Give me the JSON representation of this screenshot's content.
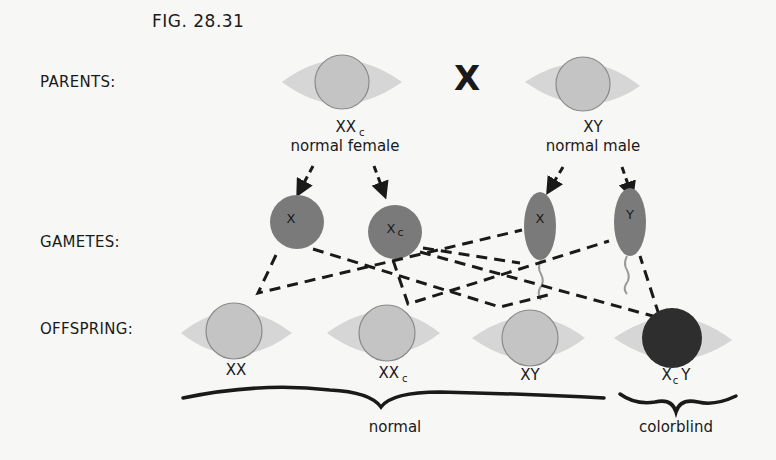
{
  "figure": {
    "title": "FIG. 28.31"
  },
  "rows": {
    "parents": "PARENTS:",
    "gametes": "GAMETES:",
    "offspring": "OFFSPRING:"
  },
  "cross_symbol": "X",
  "parents": [
    {
      "genotype_main": "XX",
      "genotype_sub": "c",
      "description": "normal female",
      "phenotype": "normal"
    },
    {
      "genotype_main": "XY",
      "genotype_sub": "",
      "description": "normal male",
      "phenotype": "normal"
    }
  ],
  "gametes": [
    {
      "label_main": "X",
      "label_sub": "",
      "type": "egg"
    },
    {
      "label_main": "X",
      "label_sub": "c",
      "type": "egg"
    },
    {
      "label_main": "X",
      "label_sub": "",
      "type": "sperm"
    },
    {
      "label_main": "Y",
      "label_sub": "",
      "type": "sperm"
    }
  ],
  "offspring": [
    {
      "genotype": "XX",
      "genotype_pre": "XX",
      "genotype_sub": "",
      "genotype_post": "",
      "phenotype": "normal"
    },
    {
      "genotype": "XXc",
      "genotype_pre": "XX",
      "genotype_sub": "c",
      "genotype_post": "",
      "phenotype": "normal"
    },
    {
      "genotype": "XY",
      "genotype_pre": "XY",
      "genotype_sub": "",
      "genotype_post": "",
      "phenotype": "normal"
    },
    {
      "genotype": "XcY",
      "genotype_pre": "X",
      "genotype_sub": "c",
      "genotype_post": "Y",
      "phenotype": "colorblind"
    }
  ],
  "groups": [
    {
      "label": "normal",
      "members": [
        "XX",
        "XXc",
        "XY"
      ]
    },
    {
      "label": "colorblind",
      "members": [
        "XcY"
      ]
    }
  ],
  "colors": {
    "background": "#f7f7f5",
    "eye_white": "#d6d6d6",
    "iris_normal": "#c4c4c4",
    "iris_colorblind": "#2e2e2e",
    "gamete": "#7a7a7a",
    "line": "#1a1a1a"
  }
}
